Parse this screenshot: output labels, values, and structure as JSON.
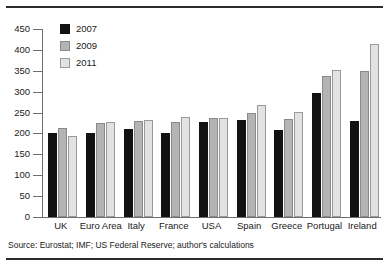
{
  "figure": {
    "source_note": "Source: Eurostat; IMF; US Federal Reserve; author's calculations"
  },
  "legend": {
    "position": "top-left-inside",
    "entries": [
      {
        "label": "2007",
        "color": "#121212"
      },
      {
        "label": "2009",
        "color": "#b4b4b4"
      },
      {
        "label": "2011",
        "color": "#e2e2e2"
      }
    ]
  },
  "axis": {
    "y_ticks": [
      "450",
      "400",
      "350",
      "300",
      "250",
      "200",
      "150",
      "100",
      "50",
      "0"
    ]
  },
  "chart_data": {
    "type": "bar",
    "title": "",
    "subtitle": "",
    "xlabel": "",
    "ylabel": "",
    "ylim": [
      0,
      450
    ],
    "ytick_step": 50,
    "grid": false,
    "legend_position": "top-left-inside",
    "categories": [
      "UK",
      "Euro Area",
      "Italy",
      "France",
      "USA",
      "Spain",
      "Greece",
      "Portugal",
      "Ireland"
    ],
    "series": [
      {
        "name": "2007",
        "color": "#121212",
        "values": [
          200,
          200,
          210,
          200,
          228,
          233,
          208,
          297,
          230
        ]
      },
      {
        "name": "2009",
        "color": "#b4b4b4",
        "values": [
          212,
          225,
          230,
          228,
          237,
          250,
          234,
          337,
          350
        ]
      },
      {
        "name": "2011",
        "color": "#e2e2e2",
        "values": [
          195,
          228,
          232,
          240,
          238,
          268,
          251,
          352,
          414
        ]
      }
    ]
  }
}
